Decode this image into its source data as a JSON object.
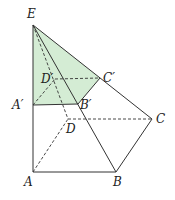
{
  "figure": {
    "shade_color": "#d4ecd4",
    "line_color": "#333333",
    "points": {
      "E": {
        "label": "E",
        "x": 33,
        "y": 25,
        "lx": 27,
        "ly": 18
      },
      "A1": {
        "label": "A′",
        "x": 33,
        "y": 105,
        "lx": 12,
        "ly": 109
      },
      "B1": {
        "label": "B′",
        "x": 78,
        "y": 104,
        "lx": 80,
        "ly": 109
      },
      "C1": {
        "label": "C′",
        "x": 100,
        "y": 78,
        "lx": 103,
        "ly": 82
      },
      "D1": {
        "label": "D′",
        "x": 55,
        "y": 79,
        "lx": 41,
        "ly": 83
      },
      "A": {
        "label": "A",
        "x": 33,
        "y": 172,
        "lx": 24,
        "ly": 186
      },
      "B": {
        "label": "B",
        "x": 116,
        "y": 172,
        "lx": 113,
        "ly": 186
      },
      "C": {
        "label": "C",
        "x": 152,
        "y": 119,
        "lx": 156,
        "ly": 123
      },
      "D": {
        "label": "D",
        "x": 68,
        "y": 119,
        "lx": 66,
        "ly": 133
      }
    }
  }
}
